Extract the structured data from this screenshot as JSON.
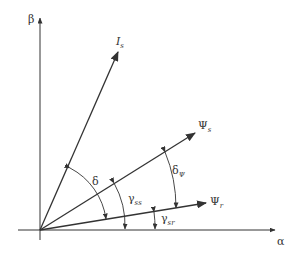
{
  "diagram": {
    "axes": {
      "vertical": "β",
      "horizontal": "α"
    },
    "vectors": [
      {
        "name": "Is",
        "symbol": "I",
        "subscript": "s"
      },
      {
        "name": "Psi_s",
        "symbol": "Ψ",
        "subscript": "s"
      },
      {
        "name": "Psi_r",
        "symbol": "Ψ",
        "subscript": "r"
      }
    ],
    "angles": [
      {
        "symbol": "δ",
        "subscript": "",
        "between": "Is and Ψr"
      },
      {
        "symbol": "δ",
        "subscript": "Ψ",
        "between": "Ψs and Ψr"
      },
      {
        "symbol": "γ",
        "subscript": "ss",
        "between": "α axis and Ψs"
      },
      {
        "symbol": "γ",
        "subscript": "sr",
        "between": "α axis and Ψr"
      }
    ],
    "colors": {
      "line": "#333333",
      "background": "#ffffff"
    }
  }
}
